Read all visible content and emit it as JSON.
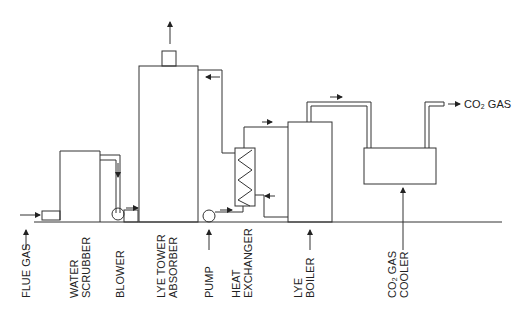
{
  "diagram": {
    "outlet_label": "CO₂ GAS",
    "labels": [
      {
        "id": "flue-gas",
        "lines": [
          "FLUE GAS"
        ]
      },
      {
        "id": "water-scrubber",
        "lines": [
          "WATER",
          "SCRUBBER"
        ]
      },
      {
        "id": "blower",
        "lines": [
          "BLOWER"
        ]
      },
      {
        "id": "lye-tower-absorber",
        "lines": [
          "LYE TOWER",
          "ABSORBER"
        ]
      },
      {
        "id": "pump",
        "lines": [
          "PUMP"
        ]
      },
      {
        "id": "heat-exchanger",
        "lines": [
          "HEAT",
          "EXCHANGER"
        ]
      },
      {
        "id": "lye-boiler",
        "lines": [
          "LYE",
          "BOILER"
        ]
      },
      {
        "id": "co2-gas-cooler",
        "lines": [
          "CO₂ GAS",
          "COOLER"
        ]
      }
    ]
  }
}
